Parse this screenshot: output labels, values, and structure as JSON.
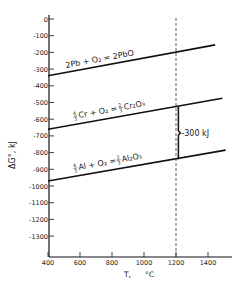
{
  "chart_data": {
    "type": "line",
    "title": "",
    "xlabel": "T, °C",
    "ylabel": "ΔG°, kJ",
    "xlim": [
      400,
      1550
    ],
    "ylim": [
      -1400,
      0
    ],
    "grid": false,
    "x_ticks": [
      400,
      600,
      800,
      1000,
      1200,
      1400
    ],
    "x_tick_labels": [
      "400",
      "600",
      "800",
      "1000",
      "1200",
      "1400"
    ],
    "y_ticks": [
      0,
      -100,
      -200,
      -300,
      -400,
      -500,
      -600,
      -700,
      -800,
      -900,
      -1000,
      -1100,
      -1200,
      -1300
    ],
    "y_tick_labels": [
      "0",
      "-100",
      "-200",
      "-300",
      "-400",
      "-500",
      "-600",
      "-700",
      "-800",
      "-900",
      "-1000",
      "-1100",
      "-1200",
      "-1300"
    ],
    "series": [
      {
        "name": "2Pb + O2 = 2PbO",
        "x": [
          400,
          1445
        ],
        "values": [
          -340,
          -155
        ]
      },
      {
        "name": "4/3 Cr + O2 = 2/3 Cr2O3",
        "x": [
          400,
          1490
        ],
        "values": [
          -660,
          -475
        ]
      },
      {
        "name": "4/3 Al + O2 = 2/3 Al2O3",
        "x": [
          400,
          1510
        ],
        "values": [
          -970,
          -785
        ]
      }
    ],
    "annotations": [
      {
        "type": "vline-dashed",
        "x": 1200
      },
      {
        "type": "bracket",
        "x": 1215,
        "from": -530,
        "to": -835,
        "label": "-300 kJ"
      }
    ]
  },
  "labels": {
    "pb": "2Pb + O₂ = 2PbO",
    "cr_text": "Cr + O₂ = ",
    "cr_prod": "Cr₂O₃",
    "al_text": "Al + O₂ = ",
    "al_prod": "Al₂O₃",
    "diff": "-300 kJ",
    "xlabel_t": "T,",
    "xlabel_u": "°C",
    "ylabel": "ΔG°,  kJ",
    "frac4": "4",
    "frac2": "2",
    "den3": "3"
  }
}
